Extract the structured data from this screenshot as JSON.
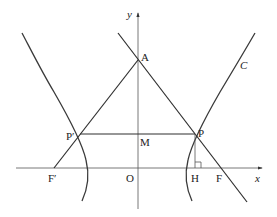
{
  "diagram": {
    "type": "hyperbola-geometry",
    "curve_label": "C",
    "axes": {
      "x_label": "x",
      "y_label": "y",
      "origin_label": "O"
    },
    "points": {
      "A": {
        "label": "A"
      },
      "P": {
        "label": "P"
      },
      "P_prime": {
        "label": "P′"
      },
      "M": {
        "label": "M"
      },
      "H": {
        "label": "H"
      },
      "F": {
        "label": "F"
      },
      "F_prime": {
        "label": "F′"
      }
    },
    "segments": [
      "F′A",
      "AP extended through F",
      "P′P",
      "PH"
    ],
    "annotations": {
      "right_angle_at": "H"
    }
  }
}
